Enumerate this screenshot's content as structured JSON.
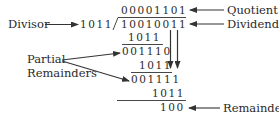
{
  "diagram": {
    "labels": {
      "divisor": "Divisor",
      "quotient": "Quotient",
      "dividend": "Dividend",
      "partial_line1": "Partial",
      "partial_line2": "Remainders",
      "remainder": "Remainder"
    },
    "values": {
      "quotient": "00001101",
      "divisor": "1011",
      "dividend": "10010011",
      "subtract1": "1011",
      "partial1": "001110",
      "subtract2": "1011",
      "partial2": "001111",
      "subtract3": "1011",
      "remainder": "100"
    },
    "colors": {
      "text": "#2a2a2a",
      "lines": "#333333",
      "background": "#ffffff"
    }
  }
}
